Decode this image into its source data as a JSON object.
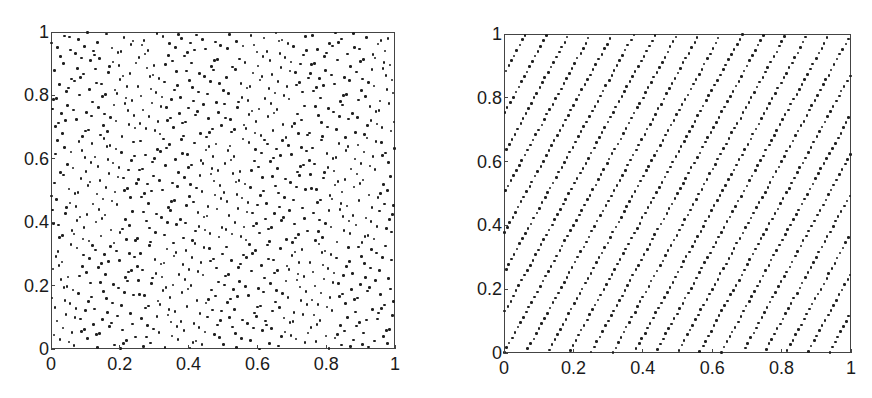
{
  "chart_data": [
    {
      "type": "scatter",
      "title": "",
      "xlabel": "",
      "ylabel": "",
      "xlim": [
        0,
        1
      ],
      "ylim": [
        0,
        1
      ],
      "grid": false,
      "legend": null,
      "xticks": [
        "0",
        "0.2",
        "0.4",
        "0.6",
        "0.8",
        "1"
      ],
      "yticks": [
        "0",
        "0.2",
        "0.4",
        "0.6",
        "0.8",
        "1"
      ],
      "description": "Quasi-random (Halton-like) point set in the unit square, irregular clustering",
      "points_generator": {
        "kind": "halton",
        "bases": [
          2,
          3
        ],
        "count": 1000
      },
      "frame_px": {
        "left": 51,
        "top": 32,
        "right": 395,
        "bottom": 349
      }
    },
    {
      "type": "scatter",
      "title": "",
      "xlabel": "",
      "ylabel": "",
      "xlim": [
        0,
        1
      ],
      "ylim": [
        0,
        1
      ],
      "grid": false,
      "legend": null,
      "xticks": [
        "0",
        "0.2",
        "0.4",
        "0.6",
        "0.8",
        "1"
      ],
      "yticks": [
        "0",
        "0.2",
        "0.4",
        "0.6",
        "0.8",
        "1"
      ],
      "description": "Lattice-like, evenly spaced point set in the unit square (rank-1 lattice pattern)",
      "points_generator": {
        "kind": "rank1-lattice",
        "n": 1000,
        "generator": [
          1,
          377
        ],
        "jitter": 0.0015
      },
      "frame_px": {
        "left": 504,
        "top": 34,
        "right": 851,
        "bottom": 353
      }
    }
  ]
}
